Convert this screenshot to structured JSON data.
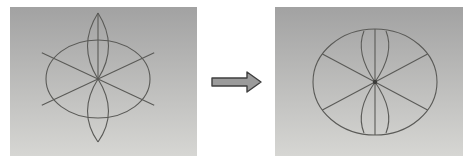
{
  "figure": {
    "colors": {
      "page_background": "#ffffff",
      "panel_gradient_top": "#a2a2a2",
      "panel_gradient_bottom": "#d6d6d3",
      "line": "#5a5a57",
      "center_dot": "#3c3c3a",
      "arrow_fill": "#9b9b9b",
      "arrow_stroke": "#3f3f3f"
    },
    "arrow": {
      "direction": "right",
      "points": "1,8 36,8 36,2 50,12 36,22 36,16 1,16"
    }
  },
  "panels": [
    {
      "id": "before",
      "label": "before-clipping",
      "viewBox": "0 0 187 149",
      "shapes": [
        {
          "name": "clip-window-circle",
          "type": "ellipse",
          "cx": 88,
          "cy": 72,
          "rx": 52,
          "ry": 39
        },
        {
          "name": "vertical-line",
          "type": "line",
          "x1": 88,
          "y1": 6,
          "x2": 88,
          "y2": 72
        },
        {
          "name": "diagonal-line-down-right",
          "type": "line",
          "x1": 31.8,
          "y1": 45.8,
          "x2": 144.2,
          "y2": 98.2
        },
        {
          "name": "diagonal-line-up-right",
          "type": "line",
          "x1": 31.8,
          "y1": 98.2,
          "x2": 144.2,
          "y2": 45.8
        },
        {
          "name": "top-petal-left-arc",
          "type": "path",
          "d": "M88,72 Q67,39 88,6"
        },
        {
          "name": "top-petal-right-arc",
          "type": "path",
          "d": "M88,72 Q109,39 88,6"
        },
        {
          "name": "bottom-petal-left-arc",
          "type": "path",
          "d": "M88,72 Q67,105 88,135"
        },
        {
          "name": "bottom-petal-right-arc",
          "type": "path",
          "d": "M88,72 Q109,105 88,135"
        }
      ]
    },
    {
      "id": "after",
      "label": "after-clipping",
      "viewBox": "0 0 188 149",
      "shapes": [
        {
          "name": "clip-window-circle",
          "type": "ellipse",
          "cx": 100,
          "cy": 75,
          "rx": 62,
          "ry": 53
        },
        {
          "name": "vertical-diameter-line",
          "type": "line",
          "x1": 100,
          "y1": 22,
          "x2": 100,
          "y2": 128
        },
        {
          "name": "diagonal-chord-down-right",
          "type": "line",
          "x1": 47.4,
          "y1": 47,
          "x2": 152.6,
          "y2": 103
        },
        {
          "name": "diagonal-chord-up-right",
          "type": "line",
          "x1": 47.4,
          "y1": 103,
          "x2": 152.6,
          "y2": 47
        },
        {
          "name": "top-petal-left-arc-clipped",
          "type": "path",
          "d": "M100,75 Q80,46 89,24"
        },
        {
          "name": "top-petal-right-arc-clipped",
          "type": "path",
          "d": "M100,75 Q120,46 111,24"
        },
        {
          "name": "bottom-petal-left-arc-clipped",
          "type": "path",
          "d": "M100,75 Q80,104 89,126"
        },
        {
          "name": "bottom-petal-right-arc-clipped",
          "type": "path",
          "d": "M100,75 Q120,104 111,126"
        },
        {
          "name": "center-dot",
          "type": "dot",
          "cx": 100,
          "cy": 75,
          "r": 2.2
        }
      ]
    }
  ]
}
